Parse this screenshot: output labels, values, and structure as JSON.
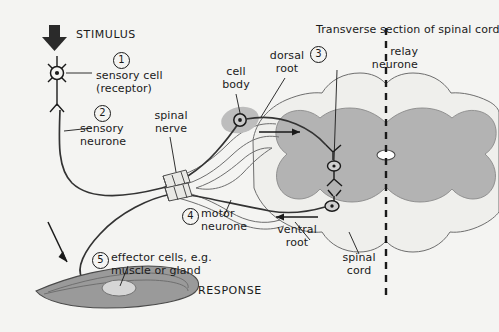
{
  "figure": {
    "title": "Transverse section of spinal cord",
    "background_color": "#f4f4f2",
    "ink_color": "#1a1a1a",
    "grey_matter_color": "#b3b3b3",
    "white_matter_color": "#efefec",
    "ganglion_color": "#bdbdbd",
    "muscle_color": "#9a9a9a"
  },
  "headings": {
    "stimulus": "STIMULUS",
    "response": "RESPONSE"
  },
  "numbered_steps": [
    {
      "number": "1",
      "label": "sensory cell\n(receptor)"
    },
    {
      "number": "2",
      "label": "sensory\nneurone"
    },
    {
      "number": "3",
      "label": "relay\nneurone"
    },
    {
      "number": "4",
      "label": "motor\nneurone"
    },
    {
      "number": "5",
      "label": "effector cells, e.g.\nmuscle or gland"
    }
  ],
  "anatomy_labels": [
    {
      "name": "spinal-nerve",
      "text": "spinal\nnerve"
    },
    {
      "name": "cell-body",
      "text": "cell\nbody"
    },
    {
      "name": "dorsal-root",
      "text": "dorsal\nroot"
    },
    {
      "name": "ventral-root",
      "text": "ventral\nroot"
    },
    {
      "name": "spinal-cord",
      "text": "spinal\ncord"
    }
  ]
}
